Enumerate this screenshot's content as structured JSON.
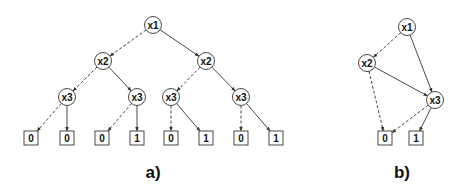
{
  "diagrams": [
    {
      "caption": "a)",
      "type": "binary-decision-tree",
      "nodes": [
        {
          "id": "n1",
          "label": "x1",
          "x": 153,
          "y": 25,
          "kind": "var"
        },
        {
          "id": "n2",
          "label": "x2",
          "x": 103,
          "y": 61,
          "kind": "var"
        },
        {
          "id": "n3",
          "label": "x2",
          "x": 206,
          "y": 61,
          "kind": "var"
        },
        {
          "id": "n4",
          "label": "x3",
          "x": 67,
          "y": 97,
          "kind": "var"
        },
        {
          "id": "n5",
          "label": "x3",
          "x": 137,
          "y": 97,
          "kind": "var"
        },
        {
          "id": "n6",
          "label": "x3",
          "x": 171,
          "y": 97,
          "kind": "var"
        },
        {
          "id": "n7",
          "label": "x3",
          "x": 241,
          "y": 97,
          "kind": "var"
        },
        {
          "id": "l1",
          "label": "0",
          "x": 31,
          "y": 138,
          "kind": "leaf"
        },
        {
          "id": "l2",
          "label": "0",
          "x": 67,
          "y": 138,
          "kind": "leaf"
        },
        {
          "id": "l3",
          "label": "0",
          "x": 102,
          "y": 138,
          "kind": "leaf"
        },
        {
          "id": "l4",
          "label": "1",
          "x": 137,
          "y": 138,
          "kind": "leaf"
        },
        {
          "id": "l5",
          "label": "0",
          "x": 171,
          "y": 138,
          "kind": "leaf"
        },
        {
          "id": "l6",
          "label": "1",
          "x": 206,
          "y": 138,
          "kind": "leaf"
        },
        {
          "id": "l7",
          "label": "0",
          "x": 241,
          "y": 138,
          "kind": "leaf"
        },
        {
          "id": "l8",
          "label": "1",
          "x": 276,
          "y": 138,
          "kind": "leaf"
        }
      ],
      "edges": [
        {
          "from": "n1",
          "to": "n2",
          "style": "dashed"
        },
        {
          "from": "n1",
          "to": "n3",
          "style": "solid"
        },
        {
          "from": "n2",
          "to": "n4",
          "style": "dashed"
        },
        {
          "from": "n2",
          "to": "n5",
          "style": "solid"
        },
        {
          "from": "n3",
          "to": "n6",
          "style": "dashed"
        },
        {
          "from": "n3",
          "to": "n7",
          "style": "solid"
        },
        {
          "from": "n4",
          "to": "l1",
          "style": "dashed"
        },
        {
          "from": "n4",
          "to": "l2",
          "style": "solid"
        },
        {
          "from": "n5",
          "to": "l3",
          "style": "dashed"
        },
        {
          "from": "n5",
          "to": "l4",
          "style": "solid"
        },
        {
          "from": "n6",
          "to": "l5",
          "style": "dashed"
        },
        {
          "from": "n6",
          "to": "l6",
          "style": "solid"
        },
        {
          "from": "n7",
          "to": "l7",
          "style": "dashed"
        },
        {
          "from": "n7",
          "to": "l8",
          "style": "solid"
        }
      ],
      "caption_pos": {
        "x": 153,
        "y": 178
      }
    },
    {
      "caption": "b)",
      "type": "reduced-ordered-bdd",
      "nodes": [
        {
          "id": "m1",
          "label": "x1",
          "x": 407,
          "y": 27,
          "kind": "var"
        },
        {
          "id": "m2",
          "label": "x2",
          "x": 367,
          "y": 63,
          "kind": "var"
        },
        {
          "id": "m3",
          "label": "x3",
          "x": 435,
          "y": 100,
          "kind": "var"
        },
        {
          "id": "k0",
          "label": "0",
          "x": 385,
          "y": 138,
          "kind": "leaf"
        },
        {
          "id": "k1",
          "label": "1",
          "x": 416,
          "y": 138,
          "kind": "leaf"
        }
      ],
      "edges": [
        {
          "from": "m1",
          "to": "m2",
          "style": "dashed"
        },
        {
          "from": "m1",
          "to": "m3",
          "style": "solid"
        },
        {
          "from": "m2",
          "to": "k0",
          "style": "dashed"
        },
        {
          "from": "m2",
          "to": "m3",
          "style": "solid"
        },
        {
          "from": "m3",
          "to": "k0",
          "style": "dashed"
        },
        {
          "from": "m3",
          "to": "k1",
          "style": "solid"
        }
      ],
      "caption_pos": {
        "x": 402,
        "y": 178
      }
    }
  ],
  "style": {
    "node_radius": 8.5,
    "leaf_size": 14,
    "stroke": "#333333",
    "background": "#ffffff"
  }
}
